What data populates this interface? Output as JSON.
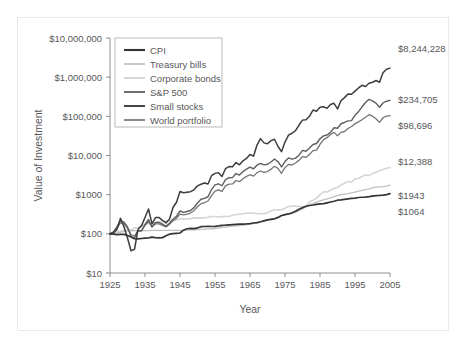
{
  "chart_data": {
    "type": "line",
    "title": "",
    "xlabel": "Year",
    "ylabel": "Value of Investment",
    "xlim": [
      1925,
      2005
    ],
    "ylim": [
      10,
      10000000
    ],
    "yscale": "log",
    "grid": false,
    "legend_position": "top-left-inside",
    "x_ticks": [
      "1925",
      "1935",
      "1945",
      "1955",
      "1965",
      "1975",
      "1985",
      "1995",
      "2005"
    ],
    "y_ticks": [
      "$10",
      "$100",
      "$1000",
      "$10,000",
      "$100,000",
      "$1,000,000",
      "$10,000,000"
    ],
    "x": [
      1925,
      1926,
      1927,
      1928,
      1929,
      1930,
      1931,
      1932,
      1933,
      1934,
      1935,
      1936,
      1937,
      1938,
      1939,
      1940,
      1941,
      1942,
      1943,
      1944,
      1945,
      1946,
      1947,
      1948,
      1949,
      1950,
      1951,
      1952,
      1953,
      1954,
      1955,
      1956,
      1957,
      1958,
      1959,
      1960,
      1961,
      1962,
      1963,
      1964,
      1965,
      1966,
      1967,
      1968,
      1969,
      1970,
      1971,
      1972,
      1973,
      1974,
      1975,
      1976,
      1977,
      1978,
      1979,
      1980,
      1981,
      1982,
      1983,
      1984,
      1985,
      1986,
      1987,
      1988,
      1989,
      1990,
      1991,
      1992,
      1993,
      1994,
      1995,
      1996,
      1997,
      1998,
      1999,
      2000,
      2001,
      2002,
      2003,
      2004,
      2005
    ],
    "series": [
      {
        "name": "Small stocks",
        "color": "#3d3d3f",
        "width": 1.5,
        "end_label": "$8,244,228",
        "end_value": 8244228,
        "values": [
          100,
          107,
          130,
          250,
          150,
          78,
          37,
          40,
          130,
          160,
          260,
          430,
          180,
          260,
          260,
          220,
          190,
          240,
          470,
          640,
          1200,
          1120,
          1160,
          1190,
          1330,
          1680,
          1840,
          1980,
          1880,
          3050,
          3500,
          3650,
          2900,
          4600,
          5200,
          5150,
          6600,
          5800,
          7300,
          8400,
          10600,
          9600,
          18500,
          27000,
          21000,
          20000,
          24000,
          26000,
          17000,
          12500,
          22000,
          33000,
          37000,
          43000,
          60000,
          80000,
          82000,
          100000,
          145000,
          135000,
          170000,
          175000,
          160000,
          200000,
          215000,
          155000,
          250000,
          300000,
          370000,
          365000,
          440000,
          530000,
          620000,
          580000,
          700000,
          740000,
          820000,
          740000,
          1300000,
          1600000,
          1700000
        ]
      },
      {
        "name": "S&P 500",
        "color": "#5e5e60",
        "width": 1.4,
        "end_label": "$234,705",
        "end_value": 234705,
        "values": [
          100,
          112,
          152,
          218,
          200,
          150,
          85,
          78,
          120,
          118,
          175,
          232,
          150,
          196,
          195,
          176,
          155,
          187,
          235,
          281,
          383,
          352,
          372,
          393,
          467,
          614,
          762,
          804,
          884,
          1350,
          1775,
          1892,
          1688,
          2420,
          2710,
          2725,
          3460,
          3158,
          3876,
          4510,
          5075,
          4566,
          5660,
          6290,
          5750,
          5980,
          6830,
          8130,
          6940,
          5100,
          7000,
          8670,
          8050,
          8580,
          10170,
          13470,
          12810,
          15570,
          19080,
          20280,
          26710,
          31680,
          33340,
          38880,
          51180,
          49580,
          64680,
          69620,
          76620,
          77620,
          106800,
          131300,
          175000,
          225000,
          272000,
          247000,
          218000,
          170000,
          219000,
          243000,
          255000
        ]
      },
      {
        "name": "World portfolio",
        "color": "#74747a",
        "width": 1.3,
        "end_label": "$98,696",
        "end_value": 98696,
        "values": [
          100,
          110,
          140,
          190,
          180,
          140,
          95,
          88,
          120,
          122,
          165,
          205,
          150,
          180,
          180,
          165,
          150,
          175,
          215,
          250,
          320,
          305,
          320,
          340,
          390,
          490,
          590,
          630,
          690,
          950,
          1230,
          1320,
          1210,
          1680,
          1860,
          1880,
          2300,
          2150,
          2550,
          2930,
          3230,
          2970,
          3620,
          4020,
          3730,
          3900,
          4480,
          5300,
          4680,
          3520,
          4900,
          5900,
          5720,
          6450,
          7500,
          9400,
          9000,
          10600,
          13300,
          13700,
          19200,
          25500,
          28500,
          34500,
          39000,
          32000,
          39000,
          41000,
          49000,
          55000,
          65000,
          72000,
          82000,
          95000,
          110000,
          101000,
          87000,
          70000,
          92000,
          101000,
          104000
        ]
      },
      {
        "name": "Corporate bonds",
        "color": "#d5d5d7",
        "width": 1.6,
        "end_label": "$12,388",
        "end_value": 12388,
        "values": [
          100,
          107,
          115,
          118,
          122,
          130,
          125,
          140,
          145,
          160,
          172,
          183,
          186,
          194,
          200,
          206,
          210,
          215,
          220,
          226,
          240,
          242,
          240,
          245,
          255,
          258,
          252,
          260,
          265,
          278,
          278,
          268,
          275,
          280,
          278,
          300,
          308,
          318,
          325,
          335,
          340,
          335,
          325,
          330,
          325,
          345,
          385,
          405,
          410,
          412,
          450,
          500,
          510,
          510,
          500,
          480,
          500,
          660,
          725,
          810,
          1000,
          1180,
          1170,
          1300,
          1450,
          1530,
          1770,
          1960,
          2190,
          2080,
          2540,
          2590,
          2900,
          3180,
          3060,
          3450,
          3750,
          4100,
          4400,
          4700,
          4900
        ]
      },
      {
        "name": "Treasury bills",
        "color": "#bfbfc1",
        "width": 1.3,
        "end_label": "$1943",
        "end_value": 1943,
        "values": [
          100,
          103,
          106,
          110,
          114,
          119,
          120,
          121,
          121,
          121,
          121,
          121,
          122,
          122,
          122,
          122,
          122,
          122,
          123,
          123,
          123,
          123,
          124,
          126,
          127,
          128,
          130,
          132,
          134,
          135,
          137,
          141,
          146,
          148,
          153,
          157,
          160,
          163,
          166,
          172,
          178,
          183,
          190,
          200,
          213,
          227,
          238,
          246,
          264,
          286,
          303,
          317,
          332,
          355,
          388,
          430,
          490,
          545,
          592,
          644,
          696,
          740,
          781,
          830,
          892,
          950,
          1000,
          1034,
          1063,
          1105,
          1166,
          1225,
          1289,
          1351,
          1415,
          1500,
          1560,
          1590,
          1610,
          1650,
          1750
        ]
      },
      {
        "name": "CPI",
        "color": "#353537",
        "width": 1.7,
        "end_label": "$1064",
        "end_value": 1064,
        "values": [
          100,
          98,
          96,
          97,
          97,
          91,
          83,
          75,
          74,
          76,
          78,
          79,
          82,
          80,
          79,
          80,
          89,
          98,
          101,
          103,
          105,
          124,
          135,
          138,
          136,
          142,
          152,
          154,
          155,
          154,
          155,
          159,
          165,
          167,
          170,
          172,
          174,
          176,
          178,
          180,
          183,
          189,
          194,
          203,
          215,
          227,
          234,
          242,
          263,
          293,
          310,
          322,
          344,
          376,
          424,
          466,
          505,
          528,
          545,
          567,
          584,
          590,
          618,
          649,
          678,
          722,
          740,
          762,
          782,
          801,
          819,
          847,
          858,
          867,
          890,
          922,
          940,
          955,
          976,
          1005,
          1064
        ]
      }
    ]
  },
  "legend": {
    "items": [
      {
        "label": "CPI"
      },
      {
        "label": "Treasury bills"
      },
      {
        "label": "Corporate bonds"
      },
      {
        "label": "S&P 500"
      },
      {
        "label": "Small stocks"
      },
      {
        "label": "World portfolio"
      }
    ]
  }
}
